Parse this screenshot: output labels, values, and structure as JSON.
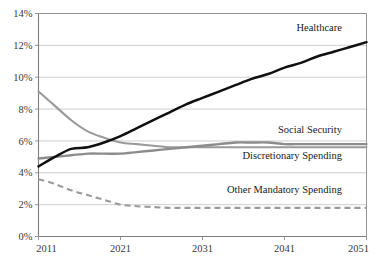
{
  "chart_data": {
    "type": "line",
    "title": "",
    "subtitle": "",
    "xlabel": "",
    "ylabel": "",
    "xlim": [
      2011,
      2051
    ],
    "ylim": [
      0,
      14
    ],
    "grid": true,
    "legend_position": "inline-right-labels",
    "x_ticks": [
      "2011",
      "2021",
      "2031",
      "2041",
      "2051"
    ],
    "x_tick_values": [
      2011,
      2021,
      2031,
      2041,
      2051
    ],
    "y_ticks": [
      "0%",
      "2%",
      "4%",
      "6%",
      "8%",
      "10%",
      "12%",
      "14%"
    ],
    "y_tick_values": [
      0,
      2,
      4,
      6,
      8,
      10,
      12,
      14
    ],
    "x": [
      2011,
      2013,
      2015,
      2017,
      2019,
      2021,
      2023,
      2025,
      2027,
      2029,
      2031,
      2033,
      2035,
      2037,
      2039,
      2041,
      2043,
      2045,
      2047,
      2049,
      2051
    ],
    "series": [
      {
        "name": "Healthcare",
        "color": "#101010",
        "style": "solid",
        "values": [
          4.4,
          5.0,
          5.5,
          5.6,
          5.9,
          6.3,
          6.8,
          7.3,
          7.8,
          8.3,
          8.7,
          9.1,
          9.5,
          9.9,
          10.2,
          10.6,
          10.9,
          11.3,
          11.6,
          11.9,
          12.2
        ]
      },
      {
        "name": "Social Security",
        "color": "#8c8c8c",
        "style": "solid",
        "values": [
          4.9,
          5.0,
          5.1,
          5.2,
          5.2,
          5.2,
          5.3,
          5.4,
          5.5,
          5.6,
          5.7,
          5.8,
          5.9,
          5.9,
          5.9,
          5.8,
          5.8,
          5.8,
          5.8,
          5.8,
          5.8
        ]
      },
      {
        "name": "Discretionary Spending",
        "color": "#9a9a9a",
        "style": "solid",
        "values": [
          9.1,
          8.2,
          7.3,
          6.6,
          6.2,
          5.9,
          5.8,
          5.7,
          5.6,
          5.6,
          5.6,
          5.6,
          5.6,
          5.6,
          5.6,
          5.6,
          5.6,
          5.6,
          5.6,
          5.6,
          5.6
        ]
      },
      {
        "name": "Other Mandatory Spending",
        "color": "#9a9a9a",
        "style": "dashed",
        "values": [
          3.6,
          3.3,
          2.9,
          2.6,
          2.3,
          2.0,
          1.9,
          1.85,
          1.8,
          1.8,
          1.8,
          1.8,
          1.8,
          1.8,
          1.8,
          1.8,
          1.8,
          1.8,
          1.8,
          1.8,
          1.8
        ]
      }
    ],
    "annotations": [
      {
        "text": "Healthcare",
        "x": 2048,
        "y": 12.9
      },
      {
        "text": "Social Security",
        "x": 2048,
        "y": 6.5
      },
      {
        "text": "Discretionary Spending",
        "x": 2048,
        "y": 4.85
      },
      {
        "text": "Other Mandatory Spending",
        "x": 2048,
        "y": 2.75
      }
    ]
  },
  "axis": {
    "y_labels": [
      "14%",
      "12%",
      "10%",
      "8%",
      "6%",
      "4%",
      "2%",
      "0%"
    ],
    "x_labels": [
      "2011",
      "2021",
      "2031",
      "2041",
      "2051"
    ]
  },
  "labels": {
    "healthcare": "Healthcare",
    "social_security": "Social Security",
    "discretionary": "Discretionary Spending",
    "other_mandatory": "Other Mandatory Spending"
  }
}
